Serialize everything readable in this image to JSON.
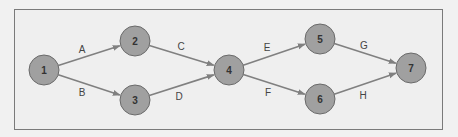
{
  "diagram": {
    "type": "network",
    "nodes": [
      {
        "id": "1",
        "label": "1",
        "x": 44,
        "y": 70
      },
      {
        "id": "2",
        "label": "2",
        "x": 135,
        "y": 41
      },
      {
        "id": "3",
        "label": "3",
        "x": 135,
        "y": 100
      },
      {
        "id": "4",
        "label": "4",
        "x": 229,
        "y": 70
      },
      {
        "id": "5",
        "label": "5",
        "x": 320,
        "y": 39
      },
      {
        "id": "6",
        "label": "6",
        "x": 320,
        "y": 99
      },
      {
        "id": "7",
        "label": "7",
        "x": 411,
        "y": 68
      }
    ],
    "edges": [
      {
        "from": "1",
        "to": "2",
        "label": "A",
        "lx": 82,
        "ly": 49
      },
      {
        "from": "1",
        "to": "3",
        "label": "B",
        "lx": 82,
        "ly": 92
      },
      {
        "from": "2",
        "to": "4",
        "label": "C",
        "lx": 181,
        "ly": 46
      },
      {
        "from": "3",
        "to": "4",
        "label": "D",
        "lx": 179,
        "ly": 96
      },
      {
        "from": "4",
        "to": "5",
        "label": "E",
        "lx": 267,
        "ly": 47
      },
      {
        "from": "4",
        "to": "6",
        "label": "F",
        "lx": 268,
        "ly": 92
      },
      {
        "from": "5",
        "to": "7",
        "label": "G",
        "lx": 364,
        "ly": 45
      },
      {
        "from": "6",
        "to": "7",
        "label": "H",
        "lx": 363,
        "ly": 95
      }
    ]
  }
}
